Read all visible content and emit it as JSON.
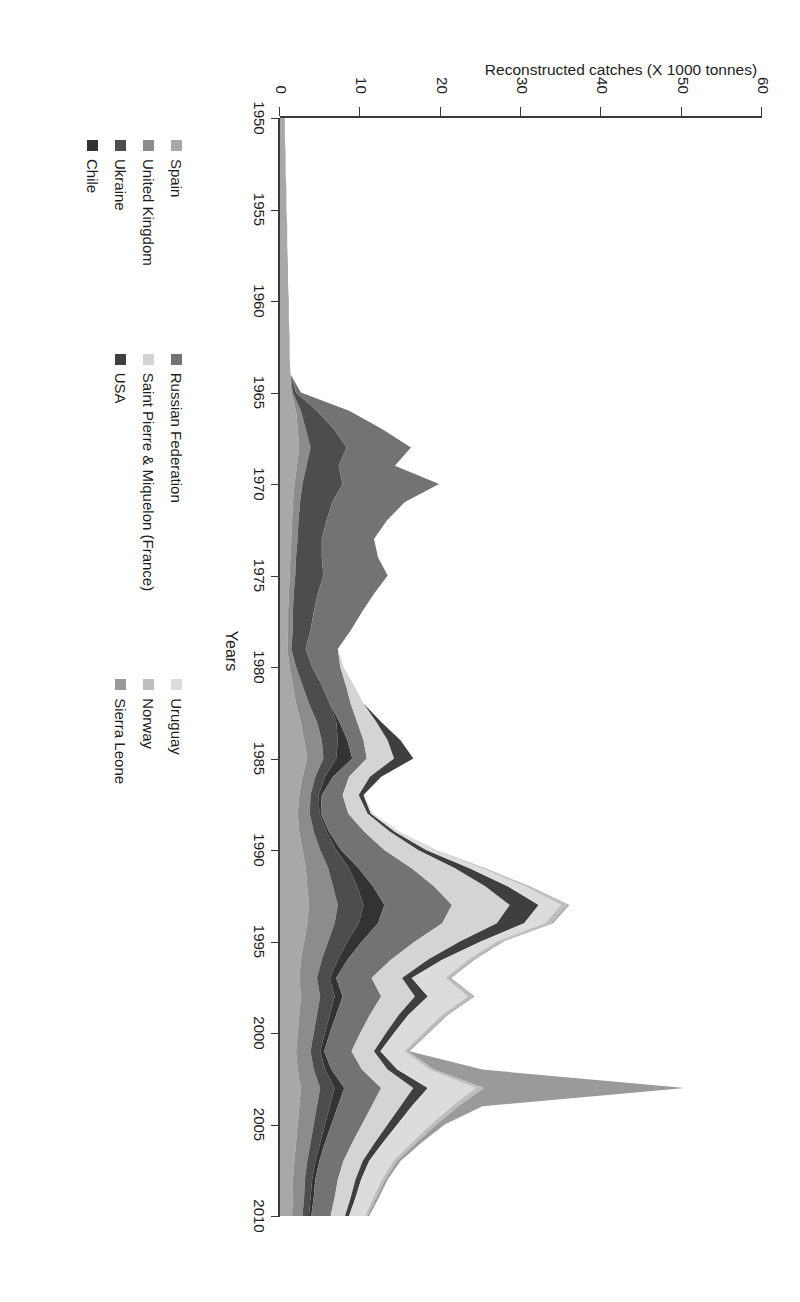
{
  "axes": {
    "y_title": "Reconstructed catches (X 1000 tonnes)",
    "x_title": "Years",
    "y_ticks": [
      "0",
      "10",
      "20",
      "30",
      "40",
      "50",
      "60"
    ],
    "x_ticks": [
      "1950",
      "1955",
      "1960",
      "1965",
      "1970",
      "1975",
      "1980",
      "1985",
      "1990",
      "1995",
      "2000",
      "2005",
      "2010"
    ]
  },
  "legend": {
    "columns": [
      {
        "items": [
          {
            "label": "Spain",
            "color": "#a8a8a8"
          },
          {
            "label": "United Kingdom",
            "color": "#8c8c8c"
          },
          {
            "label": "Ukraine",
            "color": "#4d4d4d"
          },
          {
            "label": "Chile",
            "color": "#333333"
          }
        ]
      },
      {
        "items": [
          {
            "label": "Russian Federation",
            "color": "#737373"
          },
          {
            "label": "Saint Pierre & Miquelon (France)",
            "color": "#d4d4d4"
          },
          {
            "label": "USA",
            "color": "#3f3f3f"
          }
        ]
      },
      {
        "items": [
          {
            "label": "Uruguay",
            "color": "#dcdcdc"
          },
          {
            "label": "Norway",
            "color": "#bdbdbd"
          },
          {
            "label": "Sierra Leone",
            "color": "#9a9a9a"
          }
        ]
      }
    ]
  },
  "chart_data": {
    "type": "area",
    "title": "",
    "xlabel": "Years",
    "ylabel": "Reconstructed catches (X 1000 tonnes)",
    "xlim": [
      1950,
      2010
    ],
    "ylim": [
      0,
      60
    ],
    "grid": false,
    "stacked": true,
    "legend_position": "bottom",
    "x": [
      1950,
      1951,
      1952,
      1953,
      1954,
      1955,
      1956,
      1957,
      1958,
      1959,
      1960,
      1961,
      1962,
      1963,
      1964,
      1965,
      1966,
      1967,
      1968,
      1969,
      1970,
      1971,
      1972,
      1973,
      1974,
      1975,
      1976,
      1977,
      1978,
      1979,
      1980,
      1981,
      1982,
      1983,
      1984,
      1985,
      1986,
      1987,
      1988,
      1989,
      1990,
      1991,
      1992,
      1993,
      1994,
      1995,
      1996,
      1997,
      1998,
      1999,
      2000,
      2001,
      2002,
      2003,
      2004,
      2005,
      2006,
      2007,
      2008,
      2009,
      2010
    ],
    "series": [
      {
        "name": "Spain",
        "color": "#a8a8a8",
        "values": [
          0.6,
          0.6,
          0.7,
          0.7,
          0.8,
          0.8,
          0.9,
          0.9,
          1.0,
          1.0,
          1.1,
          1.1,
          1.2,
          1.2,
          1.3,
          1.4,
          2.0,
          2.2,
          2.4,
          2.1,
          1.8,
          1.6,
          1.5,
          1.4,
          1.3,
          1.2,
          1.1,
          1.0,
          1.0,
          0.9,
          1.2,
          1.6,
          2.0,
          2.6,
          3.0,
          3.4,
          2.8,
          2.4,
          2.2,
          2.4,
          2.8,
          3.2,
          3.4,
          3.6,
          3.4,
          3.0,
          2.6,
          2.4,
          2.6,
          2.4,
          2.2,
          2.0,
          2.2,
          2.6,
          2.4,
          2.2,
          2.0,
          1.8,
          1.6,
          1.6,
          1.5
        ]
      },
      {
        "name": "United Kingdom",
        "color": "#8c8c8c",
        "values": [
          0,
          0,
          0,
          0,
          0,
          0,
          0,
          0,
          0,
          0,
          0,
          0,
          0,
          0,
          0,
          0.2,
          0.6,
          1.0,
          1.4,
          1.2,
          1.0,
          0.9,
          0.8,
          0.8,
          0.7,
          0.7,
          0.6,
          0.6,
          0.6,
          0.5,
          0.8,
          1.2,
          1.6,
          2.0,
          2.2,
          2.0,
          1.6,
          1.4,
          1.5,
          1.8,
          2.2,
          2.8,
          3.2,
          3.6,
          3.4,
          3.0,
          2.6,
          2.2,
          2.4,
          2.2,
          2.0,
          1.8,
          2.0,
          2.4,
          2.2,
          2.0,
          1.8,
          1.6,
          1.5,
          1.4,
          1.3
        ]
      },
      {
        "name": "Ukraine",
        "color": "#4d4d4d",
        "values": [
          0,
          0,
          0,
          0,
          0,
          0,
          0,
          0,
          0,
          0,
          0,
          0,
          0,
          0,
          0,
          0.4,
          2.0,
          3.5,
          4.5,
          4.0,
          5.0,
          4.0,
          3.5,
          3.0,
          3.2,
          3.5,
          3.0,
          2.6,
          2.2,
          1.8,
          2.0,
          2.4,
          2.6,
          2.4,
          2.0,
          1.6,
          1.2,
          1.0,
          1.2,
          1.6,
          2.0,
          2.6,
          3.0,
          3.2,
          3.0,
          2.4,
          2.0,
          1.6,
          1.8,
          1.6,
          1.4,
          1.2,
          1.4,
          1.8,
          1.6,
          1.4,
          1.2,
          1.0,
          0.9,
          0.8,
          0.8
        ]
      },
      {
        "name": "Chile",
        "color": "#333333",
        "values": [
          0,
          0,
          0,
          0,
          0,
          0,
          0,
          0,
          0,
          0,
          0,
          0,
          0,
          0,
          0,
          0,
          0,
          0,
          0,
          0,
          0,
          0,
          0,
          0,
          0,
          0,
          0,
          0,
          0,
          0,
          0,
          0,
          0,
          0.4,
          1.2,
          2.0,
          1.0,
          0.4,
          0.2,
          0.3,
          0.6,
          1.2,
          2.0,
          2.6,
          2.4,
          1.8,
          1.2,
          0.8,
          1.0,
          0.8,
          0.6,
          0.5,
          0.8,
          1.2,
          1.0,
          0.8,
          0.6,
          0.5,
          0.4,
          0.4,
          0.3
        ]
      },
      {
        "name": "Russian Federation",
        "color": "#737373",
        "values": [
          0,
          0,
          0,
          0,
          0,
          0,
          0,
          0,
          0,
          0,
          0,
          0,
          0,
          0,
          0,
          0.6,
          4.0,
          6.0,
          8.0,
          7.0,
          12.0,
          9.0,
          7.5,
          6.5,
          7.0,
          8.0,
          7.0,
          6.0,
          5.0,
          4.0,
          3.5,
          3.0,
          2.6,
          2.2,
          2.0,
          1.8,
          2.0,
          2.6,
          3.4,
          4.4,
          5.4,
          6.6,
          7.6,
          8.4,
          8.0,
          6.6,
          5.4,
          4.4,
          4.8,
          4.2,
          3.8,
          3.4,
          3.8,
          4.6,
          4.2,
          3.8,
          3.4,
          3.0,
          2.8,
          2.6,
          2.4
        ]
      },
      {
        "name": "Saint Pierre & Miquelon (France)",
        "color": "#d4d4d4",
        "values": [
          0,
          0,
          0,
          0,
          0,
          0,
          0,
          0,
          0,
          0,
          0,
          0,
          0,
          0,
          0,
          0,
          0,
          0,
          0,
          0,
          0,
          0,
          0,
          0,
          0,
          0,
          0,
          0,
          0,
          0,
          0.4,
          1.0,
          1.6,
          2.4,
          3.0,
          3.4,
          2.6,
          2.0,
          2.4,
          3.2,
          4.2,
          5.4,
          6.4,
          7.2,
          6.8,
          5.6,
          4.6,
          3.8,
          4.2,
          3.6,
          3.2,
          2.8,
          3.2,
          4.0,
          3.6,
          3.2,
          2.8,
          2.4,
          2.2,
          2.0,
          1.8
        ]
      },
      {
        "name": "USA",
        "color": "#3f3f3f",
        "values": [
          0,
          0,
          0,
          0,
          0,
          0,
          0,
          0,
          0,
          0,
          0,
          0,
          0,
          0,
          0,
          0,
          0,
          0,
          0,
          0,
          0,
          0,
          0,
          0,
          0,
          0,
          0,
          0,
          0,
          0,
          0,
          0,
          0,
          0.6,
          1.6,
          2.4,
          1.4,
          0.6,
          0.4,
          0.6,
          1.0,
          1.8,
          2.8,
          3.6,
          3.4,
          2.6,
          1.8,
          1.2,
          1.6,
          1.2,
          1.0,
          0.8,
          1.2,
          1.8,
          1.4,
          1.2,
          1.0,
          0.8,
          0.7,
          0.6,
          0.5
        ]
      },
      {
        "name": "Uruguay",
        "color": "#dcdcdc",
        "values": [
          0,
          0,
          0,
          0,
          0,
          0,
          0,
          0,
          0,
          0,
          0,
          0,
          0,
          0,
          0,
          0,
          0,
          0,
          0,
          0,
          0,
          0,
          0,
          0,
          0,
          0,
          0,
          0,
          0,
          0,
          0,
          0,
          0,
          0,
          0,
          0,
          0,
          0,
          0.3,
          0.6,
          1.0,
          1.6,
          2.2,
          2.8,
          2.6,
          2.0,
          3.2,
          4.2,
          5.0,
          4.2,
          3.6,
          3.0,
          4.0,
          6.0,
          5.0,
          4.2,
          3.6,
          3.0,
          2.6,
          2.2,
          2.0
        ]
      },
      {
        "name": "Norway",
        "color": "#bdbdbd",
        "values": [
          0,
          0,
          0,
          0,
          0,
          0,
          0,
          0,
          0,
          0,
          0,
          0,
          0,
          0,
          0,
          0,
          0,
          0,
          0,
          0,
          0,
          0,
          0,
          0,
          0,
          0,
          0,
          0,
          0,
          0,
          0,
          0,
          0,
          0,
          0,
          0,
          0,
          0,
          0,
          0,
          0.2,
          0.4,
          0.6,
          0.8,
          0.8,
          0.6,
          0.6,
          0.5,
          0.6,
          0.5,
          0.5,
          0.4,
          0.6,
          1.0,
          0.8,
          0.7,
          0.6,
          0.5,
          0.4,
          0.4,
          0.3
        ]
      },
      {
        "name": "Sierra Leone",
        "color": "#9a9a9a",
        "values": [
          0,
          0,
          0,
          0,
          0,
          0,
          0,
          0,
          0,
          0,
          0,
          0,
          0,
          0,
          0,
          0,
          0,
          0,
          0,
          0,
          0,
          0,
          0,
          0,
          0,
          0,
          0,
          0,
          0,
          0,
          0,
          0,
          0,
          0,
          0,
          0,
          0,
          0,
          0,
          0,
          0,
          0,
          0,
          0.2,
          0.2,
          0.2,
          0.2,
          0.2,
          0.2,
          0.2,
          0.2,
          0.2,
          6.0,
          25.0,
          3.0,
          1.0,
          0.6,
          0.4,
          0.3,
          0.3,
          0.2
        ]
      }
    ]
  }
}
